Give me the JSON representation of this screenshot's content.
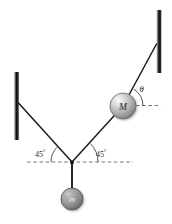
{
  "figure": {
    "kind": "free-body-diagram",
    "background_color": "#ffffff",
    "line_color": "#1d1d1d",
    "dash_color": "#5a5a5a",
    "wall_color": "#161616"
  },
  "walls": {
    "left": {
      "name": "left-wall",
      "x": 16.5,
      "y_top": 72,
      "y_bottom": 140,
      "thickness": 5.5
    },
    "right": {
      "name": "right-wall",
      "x": 159.0,
      "y_top": 10,
      "y_bottom": 73,
      "thickness": 5.5
    }
  },
  "nodes": {
    "left_anchor": {
      "label": "left-wall-anchor",
      "x": 18.5,
      "y": 103
    },
    "right_anchor": {
      "label": "right-wall-anchor",
      "x": 156.5,
      "y": 44
    },
    "junction": {
      "label": "string-junction",
      "x": 72,
      "y": 162
    },
    "M_center": {
      "label": "mass-M-center",
      "x": 123,
      "y": 106,
      "radius": 13
    },
    "m_center": {
      "label": "mass-m-center",
      "x": 72,
      "y": 199,
      "radius": 11
    }
  },
  "strings": [
    {
      "name": "string-left-wall-to-junction",
      "from": "left_anchor",
      "to": "junction"
    },
    {
      "name": "string-junction-to-M",
      "from": "junction",
      "to": "M_center"
    },
    {
      "name": "string-M-to-right-wall",
      "from": "M_center",
      "to": "right_anchor"
    },
    {
      "name": "string-junction-to-m",
      "from": "junction",
      "to": "m_center"
    }
  ],
  "dashed_lines": [
    {
      "name": "horizontal-reference-at-junction",
      "x1": 27,
      "y1": 162,
      "x2": 133,
      "y2": 162
    },
    {
      "name": "horizontal-reference-at-M",
      "x1": 136,
      "y1": 105.5,
      "x2": 161,
      "y2": 105.5
    }
  ],
  "labels": {
    "mass_M": "M",
    "mass_m": "m",
    "theta": "θ",
    "angle_left": "45",
    "angle_left_unit": "°",
    "angle_right": "45",
    "angle_right_unit": "°"
  },
  "label_positions": {
    "mass_M": {
      "x": 123,
      "y": 109.5
    },
    "mass_m": {
      "x": 72,
      "y": 202.5
    },
    "theta": {
      "x": 141.5,
      "y": 91.5
    },
    "angle_left": {
      "x": 40,
      "y": 156
    },
    "angle_right": {
      "x": 101,
      "y": 156
    }
  },
  "angle_arcs": [
    {
      "name": "arc-45-left",
      "cx": 72,
      "cy": 162,
      "r": 21,
      "start_deg": 180,
      "end_deg": 135
    },
    {
      "name": "arc-45-right",
      "cx": 72,
      "cy": 162,
      "r": 26,
      "start_deg": 0,
      "end_deg": 45
    },
    {
      "name": "arc-theta",
      "cx": 123,
      "cy": 106,
      "r": 20,
      "start_deg": 0,
      "end_deg": 57
    }
  ],
  "colors": {
    "ball_highlight": "#f0f0f0",
    "ball_mid": "#b8b8b8",
    "ball_edge": "#6e6e6e",
    "ball_m_highlight": "#cfcfcf",
    "ball_m_mid": "#9a9a9a",
    "ball_m_edge": "#5c5c5c",
    "stroke": "#1d1d1d"
  }
}
